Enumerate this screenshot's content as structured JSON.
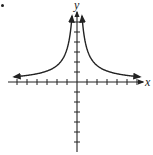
{
  "chart_data": {
    "type": "line",
    "title": "",
    "xlabel": "x",
    "ylabel": "y",
    "function": "y = k/|x| (vertical asymptote x=0, horizontal asymptote y=0)",
    "k": 3.3,
    "xlim": [
      -6.5,
      6.5
    ],
    "ylim": [
      -7,
      7.5
    ],
    "x_ticks": [
      -6,
      -5,
      -4,
      -3,
      -2,
      -1,
      1,
      2,
      3,
      4,
      5,
      6
    ],
    "y_ticks": [
      -6,
      -5,
      -4,
      -3,
      -2,
      -1,
      1,
      2,
      3,
      4,
      5,
      6
    ],
    "tick_labels_shown": false,
    "grid": false,
    "legend": null,
    "series": [
      {
        "name": "left branch",
        "x": [
          -6.2,
          -5,
          -4,
          -3,
          -2,
          -1.5,
          -1,
          -0.75,
          -0.55
        ],
        "y": [
          0.53,
          0.66,
          0.83,
          1.1,
          1.65,
          2.2,
          3.3,
          4.4,
          6.0
        ]
      },
      {
        "name": "right branch",
        "x": [
          0.55,
          0.75,
          1,
          1.5,
          2,
          3,
          4,
          5,
          6.2
        ],
        "y": [
          6.0,
          4.4,
          3.3,
          2.2,
          1.65,
          1.1,
          0.83,
          0.66,
          0.53
        ]
      }
    ],
    "colors": {
      "axes": "#222222",
      "curve": "#222222"
    }
  },
  "labels": {
    "x": "x",
    "y": "y"
  }
}
